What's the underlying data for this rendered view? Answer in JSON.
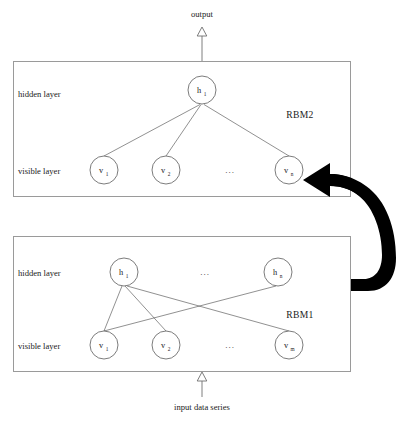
{
  "diagram": {
    "type": "neural-network-architecture",
    "canvas": {
      "width": 404,
      "height": 427
    },
    "colors": {
      "background": "#ffffff",
      "box_stroke": "#9a9a9a",
      "node_stroke": "#5a5a5a",
      "node_fill": "#ffffff",
      "edge_stroke": "#555555",
      "text": "#222222",
      "thick_arrow": "#000000"
    },
    "io": {
      "output_label": "output",
      "input_label": "input data series"
    },
    "blocks": [
      {
        "id": "rbm2",
        "name": "RBM2",
        "label": "RBM2",
        "box": {
          "x": 13,
          "y": 61,
          "width": 338,
          "height": 136
        },
        "label_pos": {
          "x": 300,
          "y": 118
        },
        "layers": [
          {
            "id": "rbm2-hidden",
            "label": "hidden layer",
            "label_pos": {
              "x": 18,
              "y": 97
            },
            "row_y": 90,
            "ellipsis": null,
            "nodes": [
              {
                "id": "rbm2-h1",
                "base": "h",
                "sub": "1",
                "cx": 202,
                "cy": 90,
                "r": 14
              }
            ]
          },
          {
            "id": "rbm2-visible",
            "label": "visible layer",
            "label_pos": {
              "x": 18,
              "y": 174
            },
            "row_y": 170,
            "ellipsis": {
              "text": "...",
              "x": 230,
              "y": 173
            },
            "nodes": [
              {
                "id": "rbm2-v1",
                "base": "v",
                "sub": "1",
                "cx": 104,
                "cy": 170,
                "r": 14
              },
              {
                "id": "rbm2-v2",
                "base": "v",
                "sub": "2",
                "cx": 166,
                "cy": 170,
                "r": 14
              },
              {
                "id": "rbm2-vn",
                "base": "v",
                "sub": "n",
                "cx": 289,
                "cy": 170,
                "r": 14
              }
            ]
          }
        ],
        "edges": [
          {
            "from": "rbm2-v1",
            "to": "rbm2-h1"
          },
          {
            "from": "rbm2-v2",
            "to": "rbm2-h1"
          },
          {
            "from": "rbm2-vn",
            "to": "rbm2-h1"
          }
        ]
      },
      {
        "id": "rbm1",
        "name": "RBM1",
        "label": "RBM1",
        "box": {
          "x": 13,
          "y": 236,
          "width": 338,
          "height": 136
        },
        "label_pos": {
          "x": 300,
          "y": 318
        },
        "layers": [
          {
            "id": "rbm1-hidden",
            "label": "hidden layer",
            "label_pos": {
              "x": 18,
              "y": 276
            },
            "row_y": 272,
            "ellipsis": {
              "text": "...",
              "x": 205,
              "y": 275
            },
            "nodes": [
              {
                "id": "rbm1-h1",
                "base": "h",
                "sub": "1",
                "cx": 124,
                "cy": 272,
                "r": 14
              },
              {
                "id": "rbm1-hn",
                "base": "h",
                "sub": "n",
                "cx": 278,
                "cy": 272,
                "r": 14
              }
            ]
          },
          {
            "id": "rbm1-visible",
            "label": "visible layer",
            "label_pos": {
              "x": 18,
              "y": 349
            },
            "row_y": 345,
            "ellipsis": {
              "text": "...",
              "x": 230,
              "y": 348
            },
            "nodes": [
              {
                "id": "rbm1-v1",
                "base": "v",
                "sub": "1",
                "cx": 104,
                "cy": 345,
                "r": 14
              },
              {
                "id": "rbm1-v2",
                "base": "v",
                "sub": "2",
                "cx": 166,
                "cy": 345,
                "r": 14
              },
              {
                "id": "rbm1-vm",
                "base": "v",
                "sub": "m",
                "cx": 289,
                "cy": 345,
                "r": 14
              }
            ]
          }
        ],
        "edges": [
          {
            "from": "rbm1-v1",
            "to": "rbm1-h1"
          },
          {
            "from": "rbm1-v2",
            "to": "rbm1-h1"
          },
          {
            "from": "rbm1-vm",
            "to": "rbm1-h1"
          },
          {
            "from": "rbm1-v1",
            "to": "rbm1-hn"
          }
        ]
      }
    ],
    "flow_arrow": {
      "name": "rbm1-to-rbm2-arrow",
      "description": "thick black curved arrow from RBM1 right side looping up into RBM2 visible layer"
    }
  }
}
